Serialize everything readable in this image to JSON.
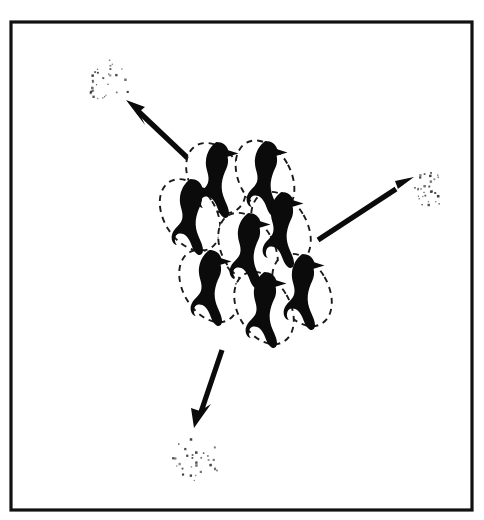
{
  "figure": {
    "background_color": "#ffffff",
    "ink_color": "#0b0b0b",
    "dot_color": "#3a3a3a",
    "frame": {
      "label": "panel-border",
      "x": 11,
      "y": 22,
      "width": 461,
      "height": 488,
      "stroke_width": 3.2
    },
    "flock": {
      "label": "central flock",
      "bird_count": 8,
      "ellipse_count": 8,
      "ellipse_style": "dashed",
      "birds": [
        {
          "name": "bird-1",
          "cx": 216,
          "cy": 178,
          "rx": 26,
          "ry": 38,
          "rot": -32,
          "scale": 1.0
        },
        {
          "name": "bird-2",
          "cx": 265,
          "cy": 177,
          "rx": 26,
          "ry": 39,
          "rot": -28,
          "scale": 1.0
        },
        {
          "name": "bird-3",
          "cx": 190,
          "cy": 215,
          "rx": 26,
          "ry": 39,
          "rot": -32,
          "scale": 1.0
        },
        {
          "name": "bird-4",
          "cx": 281,
          "cy": 228,
          "rx": 26,
          "ry": 39,
          "rot": -30,
          "scale": 1.0
        },
        {
          "name": "bird-5",
          "cx": 248,
          "cy": 249,
          "rx": 26,
          "ry": 39,
          "rot": -30,
          "scale": 1.0
        },
        {
          "name": "bird-6",
          "cx": 209,
          "cy": 286,
          "rx": 26,
          "ry": 39,
          "rot": -30,
          "scale": 1.0
        },
        {
          "name": "bird-7",
          "cx": 302,
          "cy": 290,
          "rx": 26,
          "ry": 39,
          "rot": -30,
          "scale": 1.0
        },
        {
          "name": "bird-8",
          "cx": 264,
          "cy": 308,
          "rx": 26,
          "ry": 39,
          "rot": -30,
          "scale": 1.0
        }
      ]
    },
    "arrows": [
      {
        "name": "arrow-upper-left",
        "direction": "up-left",
        "from_x": 194,
        "from_y": 164,
        "to_x": 131,
        "to_y": 104,
        "target_cluster": "dust-cluster-upper-left"
      },
      {
        "name": "arrow-right",
        "direction": "up-right",
        "from_x": 318,
        "from_y": 240,
        "to_x": 412,
        "to_y": 178,
        "target_cluster": "dust-cluster-right"
      },
      {
        "name": "arrow-lower-left",
        "direction": "down-left",
        "from_x": 222,
        "from_y": 350,
        "to_x": 196,
        "to_y": 425,
        "target_cluster": "dust-cluster-lower"
      }
    ],
    "dust_clusters": [
      {
        "name": "dust-cluster-upper-left",
        "cx": 111,
        "cy": 82,
        "rx": 25,
        "ry": 22,
        "dot_count": 30,
        "seed": 11
      },
      {
        "name": "dust-cluster-right",
        "cx": 432,
        "cy": 185,
        "rx": 24,
        "ry": 23,
        "dot_count": 30,
        "seed": 27
      },
      {
        "name": "dust-cluster-lower",
        "cx": 196,
        "cy": 460,
        "rx": 24,
        "ry": 23,
        "dot_count": 30,
        "seed": 43
      }
    ]
  },
  "chart_data": {
    "type": "diagram",
    "elements": {
      "birds": 8,
      "dashed_ellipses": 8,
      "arrows": 3,
      "dust_clusters": 3,
      "dots_per_cluster": 30
    },
    "arrow_directions": [
      "up-left",
      "up-right",
      "down-left"
    ],
    "legend": [],
    "annotations": []
  }
}
